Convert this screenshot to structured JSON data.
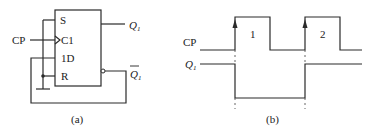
{
  "figure_a": {
    "caption": "(a)",
    "block": {
      "pins_left": [
        "S",
        "C1",
        "1D",
        "R"
      ]
    },
    "input_label": "CP",
    "outputs": {
      "q": "Q",
      "q_sub": "1",
      "qbar": "Q",
      "qbar_sub": "1"
    }
  },
  "figure_b": {
    "caption": "(b)",
    "signal_labels": {
      "cp": "CP",
      "q": "Q",
      "q_sub": "1"
    },
    "pulse_labels": [
      "1",
      "2"
    ]
  },
  "colors": {
    "line": "#2a2a2a",
    "background": "#ffffff"
  }
}
